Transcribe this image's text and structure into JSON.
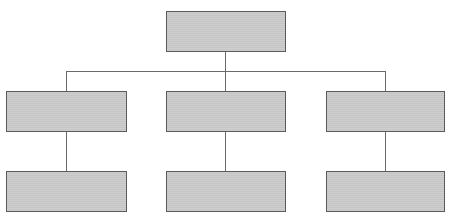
{
  "diagram": {
    "type": "org-chart",
    "colors": {
      "node_fill": "#c9c9c9",
      "node_border": "#5a5a5a",
      "connector": "#6a6a6a"
    },
    "root": {
      "label": ""
    },
    "level2": [
      {
        "label": ""
      },
      {
        "label": ""
      },
      {
        "label": ""
      }
    ],
    "level3": [
      {
        "label": ""
      },
      {
        "label": ""
      },
      {
        "label": ""
      }
    ]
  }
}
